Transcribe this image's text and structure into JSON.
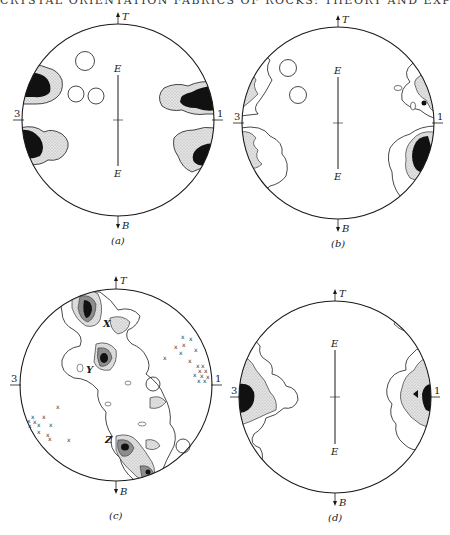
{
  "page": {
    "running_head": "CRYSTAL ORIENTATION FABRICS OF ROCKS: THEORY AND EXPERIMENT"
  },
  "figure": {
    "type": "stereographic-projection-fabric-diagrams",
    "colors": {
      "outline": "#1a1a1a",
      "dense": "#111111",
      "stipple": "#d9d9d9",
      "medium": "#8c8c8c",
      "background": "#ffffff"
    },
    "panels": [
      {
        "id": "a",
        "caption": "(a)",
        "top_label": "T",
        "bottom_label": "B",
        "left_label": "3",
        "right_label": "1",
        "axis_top_label": "E",
        "axis_bottom_label": "E",
        "features": "four dense maxima near the 1–3 axis, three empty circles in upper-left quadrant"
      },
      {
        "id": "b",
        "caption": "(b)",
        "top_label": "T",
        "bottom_label": "B",
        "left_label": "3",
        "right_label": "1",
        "axis_top_label": "E",
        "axis_bottom_label": "E",
        "features": "girdles along left and right margins, dense maximum lower-right, two empty circles upper-left"
      },
      {
        "id": "c",
        "caption": "(c)",
        "top_label": "T",
        "bottom_label": "B",
        "left_label": "3",
        "right_label": "1",
        "maxima_labels": [
          "X",
          "Y",
          "Z"
        ],
        "point_symbol": "x",
        "features": "oblique girdle with maxima X, Y, Z; scattered x points in upper-right and lower-left"
      },
      {
        "id": "d",
        "caption": "(d)",
        "top_label": "T",
        "bottom_label": "B",
        "left_label": "3",
        "right_label": "1",
        "axis_top_label": "E",
        "axis_bottom_label": "E",
        "features": "dense maxima at 3 and 1 positions with stippled halos"
      }
    ]
  }
}
